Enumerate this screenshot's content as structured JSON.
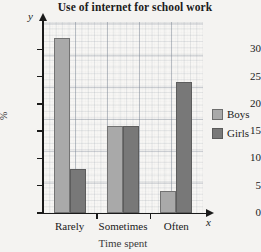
{
  "chart_data": {
    "type": "bar",
    "title": "Use of internet for school work",
    "categories": [
      "Rarely",
      "Sometimes",
      "Often"
    ],
    "series": [
      {
        "name": "Boys",
        "color": "#a9a9a9",
        "values": [
          32,
          16,
          4
        ]
      },
      {
        "name": "Girls",
        "color": "#787878",
        "values": [
          8,
          16,
          24
        ]
      }
    ],
    "xlabel": "Time spent",
    "ylabel": "%",
    "ylim": [
      0,
      35
    ],
    "yticks": [
      0,
      5,
      10,
      15,
      20,
      25,
      30
    ],
    "ytick_labels": [
      "0",
      "5",
      "10",
      "15",
      "20",
      "25",
      "30"
    ],
    "grid": true,
    "legend_position": "right",
    "x_axis_letter": "x",
    "y_axis_letter": "y"
  },
  "legend": {
    "items": [
      {
        "label": "Boys"
      },
      {
        "label": "Girls"
      }
    ]
  }
}
